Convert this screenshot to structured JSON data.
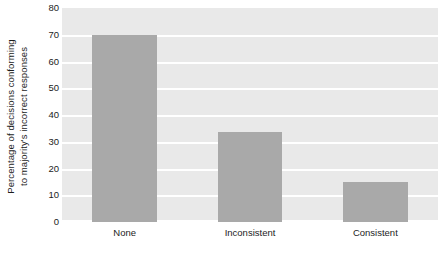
{
  "chart_data": {
    "type": "bar",
    "title": "",
    "subtitle": "",
    "xlabel": "",
    "ylabel_lines": [
      "Percentage of decisions conforming",
      "to majority's incorrect responses"
    ],
    "ylabel": "Percentage of decisions conforming to majority's incorrect responses",
    "categories": [
      "None",
      "Inconsistent",
      "Consistent"
    ],
    "values": [
      70,
      33.5,
      15
    ],
    "ylim": [
      0,
      80
    ],
    "ytick_step": 10,
    "yticks": [
      0,
      10,
      20,
      30,
      40,
      50,
      60,
      70,
      80
    ],
    "ytick_labels": [
      "0",
      "10",
      "20",
      "30",
      "40",
      "50",
      "60",
      "70",
      "80"
    ],
    "grid": true,
    "grid_axis": "y",
    "legend": false,
    "legend_position": "none",
    "colors": {
      "bar": "#a9a9a9",
      "plot_background": "#e9e9e9",
      "gridline": "#ffffff",
      "page_background": "#ffffff",
      "text": "#1c1c1c"
    }
  }
}
